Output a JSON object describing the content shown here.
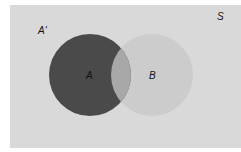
{
  "diagram": {
    "type": "venn",
    "universal_set_label": "S",
    "complement_label": "A'",
    "sets": [
      {
        "label": "A",
        "cx": 90,
        "cy": 75,
        "r": 41,
        "fill": "#4a4a4a"
      },
      {
        "label": "B",
        "cx": 152,
        "cy": 75,
        "r": 41,
        "fill": "#cccccc"
      }
    ],
    "intersection_fill": "#a8a8a8",
    "background": "#d9d9d9",
    "shaded_region": "A"
  }
}
